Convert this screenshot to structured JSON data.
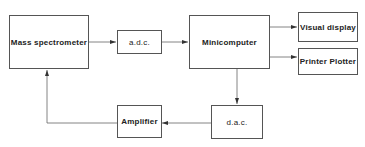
{
  "diagram": {
    "type": "block-diagram",
    "nodes": [
      {
        "id": "mass_spec",
        "label": "Mass spectrometer"
      },
      {
        "id": "adc",
        "label": "a.d.c."
      },
      {
        "id": "minicomputer",
        "label": "Minicomputer"
      },
      {
        "id": "visual_display",
        "label": "Visual display"
      },
      {
        "id": "printer_plotter",
        "label": "Printer Plotter"
      },
      {
        "id": "dac",
        "label": "d.a.c."
      },
      {
        "id": "amplifier",
        "label": "Amplifier"
      }
    ],
    "edges": [
      {
        "from": "mass_spec",
        "to": "adc"
      },
      {
        "from": "adc",
        "to": "minicomputer"
      },
      {
        "from": "minicomputer",
        "to": "visual_display"
      },
      {
        "from": "minicomputer",
        "to": "printer_plotter"
      },
      {
        "from": "minicomputer",
        "to": "dac"
      },
      {
        "from": "dac",
        "to": "amplifier"
      },
      {
        "from": "amplifier",
        "to": "mass_spec"
      }
    ],
    "colors": {
      "line": "#555555",
      "text": "#222222",
      "background": "#ffffff"
    }
  }
}
